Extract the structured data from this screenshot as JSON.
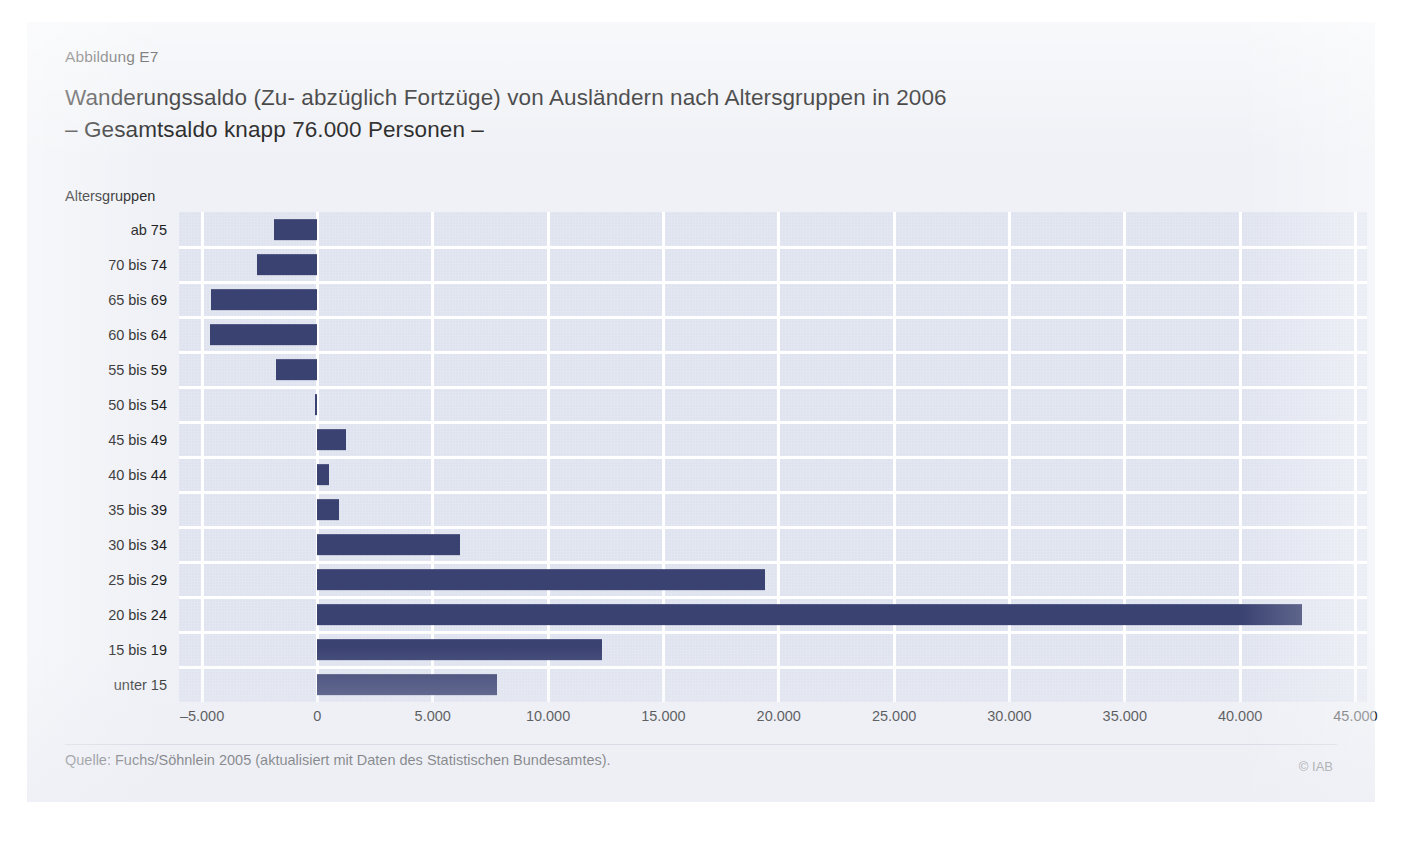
{
  "figure": {
    "label": "Abbildung E7",
    "title_line1": "Wanderungssaldo (Zu- abzüglich Fortzüge) von Ausländern nach Altersgruppen in 2006",
    "title_line2": "– Gesamtsaldo knapp 76.000 Personen –",
    "axis_caption": "Altersgruppen",
    "source": "Quelle: Fuchs/Söhnlein 2005 (aktualisiert mit Daten des Statistischen Bundesamtes).",
    "copyright": "© IAB"
  },
  "colors": {
    "bar": "#3a4272",
    "plot_background": "#dfe3ef",
    "gridline": "#ffffff",
    "card_background": "#eff1f6",
    "text": "#1b1b1b"
  },
  "chart_data": {
    "type": "bar",
    "orientation": "horizontal",
    "title": "Wanderungssaldo (Zu- abzüglich Fortzüge) von Ausländern nach Altersgruppen in 2006",
    "subtitle": "– Gesamtsaldo knapp 76.000 Personen –",
    "xlabel": "",
    "ylabel": "Altersgruppen",
    "xlim": [
      -6000,
      45500
    ],
    "xticks": [
      -5000,
      0,
      5000,
      10000,
      15000,
      20000,
      25000,
      30000,
      35000,
      40000,
      45000
    ],
    "xtick_labels": [
      "–5.000",
      "0",
      "5.000",
      "10.000",
      "15.000",
      "20.000",
      "25.000",
      "30.000",
      "35.000",
      "40.000",
      "45.000"
    ],
    "grid": "vertical-and-horizontal",
    "legend": "none",
    "categories": [
      "ab 75",
      "70 bis 74",
      "65 bis 69",
      "60 bis 64",
      "55 bis 59",
      "50 bis 54",
      "45 bis 49",
      "40 bis 44",
      "35 bis 39",
      "30 bis 34",
      "25 bis 29",
      "20 bis 24",
      "15 bis 19",
      "unter 15"
    ],
    "values": [
      -1900,
      -2600,
      -4600,
      -4650,
      -1800,
      -100,
      1250,
      500,
      950,
      6200,
      19400,
      42700,
      12350,
      7800
    ],
    "total_label": "knapp 76.000 Personen"
  }
}
